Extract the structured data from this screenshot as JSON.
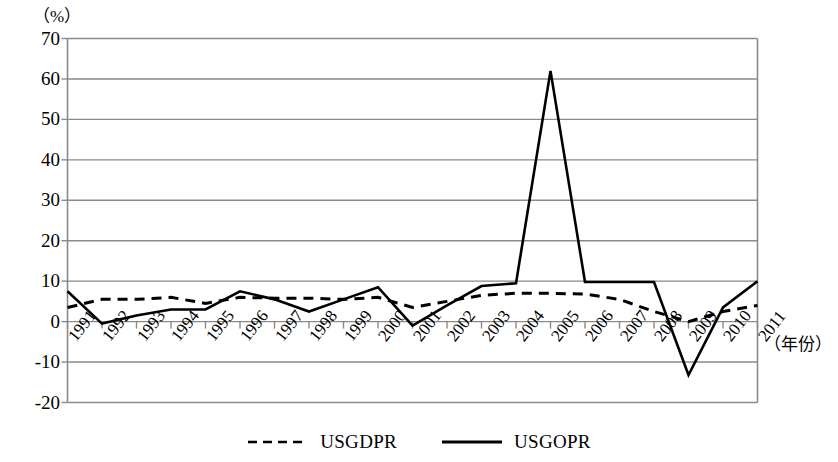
{
  "chart_data": {
    "type": "line",
    "title": "",
    "unit_label": "（%）",
    "xlabel": "（年份）",
    "ylabel": "",
    "grid": true,
    "legend_position": "bottom-center",
    "ylim": [
      -20,
      70
    ],
    "yticks": [
      70,
      60,
      50,
      40,
      30,
      20,
      10,
      0,
      -10,
      -20
    ],
    "ytick_labels": [
      "70",
      "60",
      "50",
      "40",
      "30",
      "20",
      "10",
      "0",
      "-10",
      "-20"
    ],
    "categories": [
      "1991",
      "1992",
      "1993",
      "1994",
      "1995",
      "1996",
      "1997",
      "1998",
      "1999",
      "2000",
      "2001",
      "2002",
      "2003",
      "2004",
      "2005",
      "2006",
      "2007",
      "2008",
      "2009",
      "2010",
      "2011"
    ],
    "series": [
      {
        "name": "USGDPR",
        "style": "dashed",
        "color": "#000000",
        "values": [
          3.5,
          5.5,
          5.5,
          6.0,
          4.5,
          6.0,
          5.8,
          5.8,
          5.5,
          6.0,
          3.5,
          5.0,
          6.5,
          7.0,
          7.0,
          6.8,
          5.5,
          2.5,
          0.0,
          2.5,
          4.0
        ]
      },
      {
        "name": "USGOPR",
        "style": "solid",
        "color": "#000000",
        "values": [
          7.5,
          -0.5,
          1.5,
          3.0,
          3.0,
          7.5,
          5.5,
          2.5,
          5.5,
          8.5,
          -1.0,
          4.0,
          8.8,
          9.5,
          62.0,
          9.8,
          9.8,
          9.8,
          -13.2,
          3.5,
          10.0
        ]
      }
    ]
  },
  "legend": {
    "items": [
      {
        "label": "USGDPR",
        "style": "dashed"
      },
      {
        "label": "USGOPR",
        "style": "solid"
      }
    ]
  }
}
